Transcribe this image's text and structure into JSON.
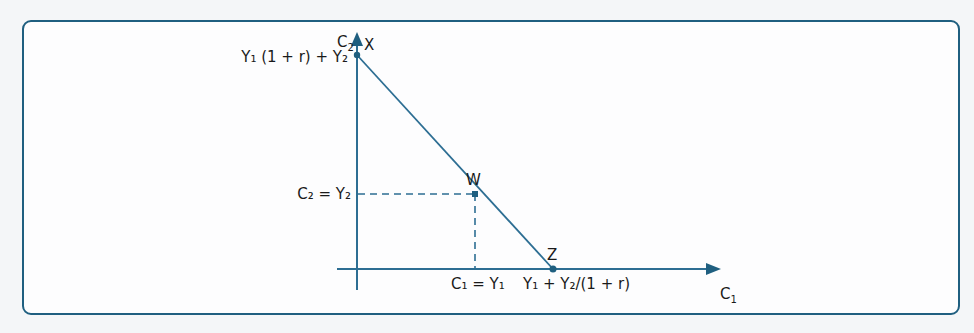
{
  "diagram": {
    "colors": {
      "frame": "#1f5f80",
      "axis": "#2d6e93",
      "line": "#2d6e93",
      "point": "#1f5f80",
      "text": "#1a1a1a"
    },
    "axes": {
      "y_axis_label": {
        "main": "C",
        "sub": "2"
      },
      "x_axis_label": {
        "main": "C",
        "sub": "1"
      }
    },
    "points": [
      {
        "id": "X",
        "label": "X"
      },
      {
        "id": "W",
        "label": "W"
      },
      {
        "id": "Z",
        "label": "Z"
      }
    ],
    "labels": {
      "x_intercept_y": "Y₁ (1 + r) + Y₂",
      "w_y": "C₂ = Y₂",
      "w_x": "C₁ = Y₁",
      "z_x": "Y₁ + Y₂/(1 + r)"
    }
  }
}
